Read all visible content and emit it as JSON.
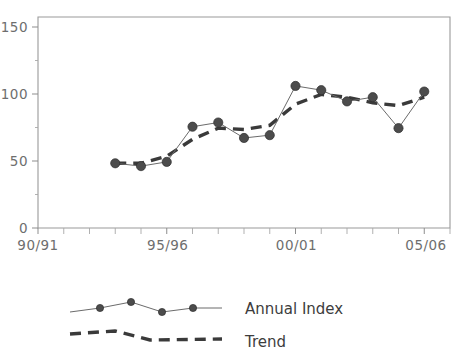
{
  "chart_data": {
    "type": "line",
    "title": "",
    "subtitle": "",
    "xlabel": "",
    "ylabel": "",
    "xlim": [
      0,
      16
    ],
    "ylim": [
      0,
      150
    ],
    "grid": false,
    "legend_position": "bottom",
    "x_tick_count": 17,
    "x_tick_labels": [
      "90/91",
      "95/96",
      "00/01",
      "05/06"
    ],
    "x_tick_label_positions": [
      0,
      5,
      10,
      15
    ],
    "x_categories": [
      "90/91",
      "91/92",
      "92/93",
      "93/94",
      "94/95",
      "95/96",
      "96/97",
      "97/98",
      "98/99",
      "99/00",
      "00/01",
      "01/02",
      "02/03",
      "03/04",
      "04/05",
      "05/06"
    ],
    "y_ticks": [
      0,
      50,
      100,
      150
    ],
    "y_tick_labels": [
      "0",
      "50",
      "100",
      "150"
    ],
    "y_minor_ticks": [
      25,
      75,
      125
    ],
    "series": [
      {
        "name": "Annual Index",
        "style": "solid-with-markers",
        "color": "#4c4c4c",
        "x": [
          3,
          4,
          5,
          6,
          7,
          8,
          9,
          10,
          11,
          12,
          13,
          14,
          15
        ],
        "values": [
          46,
          44,
          47,
          72,
          75,
          64,
          66,
          101,
          98,
          90,
          93,
          71,
          97
        ]
      },
      {
        "name": "Trend",
        "style": "dashed",
        "color": "#3a3a3a",
        "x": [
          3,
          4,
          5,
          6,
          7,
          8,
          9,
          10,
          11,
          12,
          13,
          14,
          15
        ],
        "values": [
          46,
          46,
          51,
          63,
          71,
          70,
          73,
          88,
          95,
          93,
          89,
          87,
          93
        ]
      }
    ]
  },
  "legend": {
    "entries": [
      {
        "label": "Annual Index",
        "marker": "circle",
        "line": "solid"
      },
      {
        "label": "Trend",
        "marker": "none",
        "line": "dashed"
      }
    ]
  },
  "axes": {
    "y_labels": [
      "150",
      "100",
      "50",
      "0"
    ],
    "x_labels": [
      "90/91",
      "95/96",
      "00/01",
      "05/06"
    ]
  }
}
